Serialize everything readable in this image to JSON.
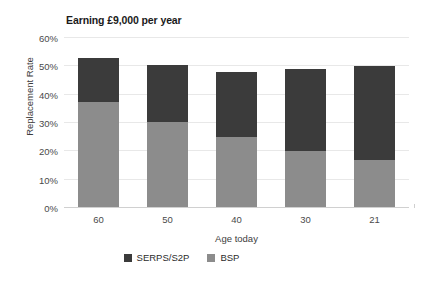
{
  "chart_data": {
    "type": "bar",
    "subtype": "stacked-column",
    "title": "Earning £9,000 per year",
    "xlabel": "Age today",
    "ylabel": "Replacement Rate",
    "categories": [
      "60",
      "50",
      "40",
      "30",
      "21"
    ],
    "series": [
      {
        "name": "BSP",
        "color": "#8c8c8c",
        "values": [
          37.5,
          30.5,
          25.0,
          20.0,
          17.0
        ]
      },
      {
        "name": "SERPS/S2P",
        "color": "#3b3b3b",
        "values": [
          15.5,
          20.0,
          23.0,
          29.0,
          33.0
        ]
      }
    ],
    "totals": [
      53.0,
      50.5,
      48.0,
      49.0,
      50.0
    ],
    "ylim": [
      0,
      60
    ],
    "yticks": [
      0,
      10,
      20,
      30,
      40,
      50,
      60
    ],
    "ytick_labels": [
      "0%",
      "10%",
      "20%",
      "30%",
      "40%",
      "50%",
      "60%"
    ],
    "value_suffix": "%",
    "grid": true,
    "grid_axis": "y",
    "legend_position": "bottom",
    "legend_order": [
      "SERPS/S2P",
      "BSP"
    ],
    "background": "#ffffff",
    "gridline_color": "#e8e8e8"
  }
}
